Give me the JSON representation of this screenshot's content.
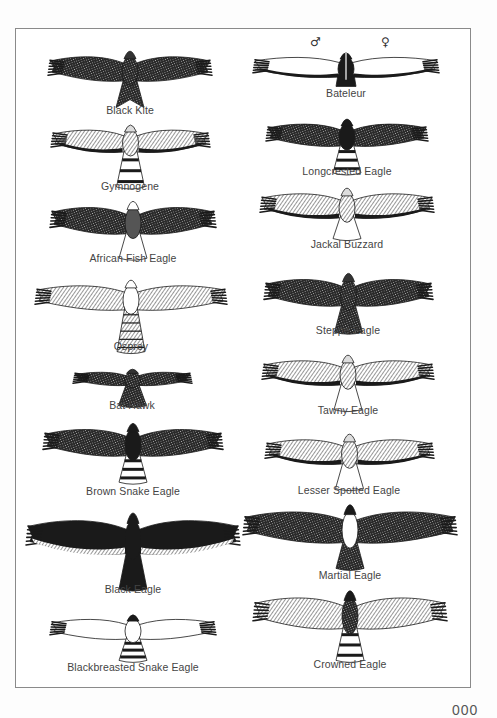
{
  "page": {
    "page_number": "000",
    "colors": {
      "ink": "#1a1a1a",
      "frame": "#8a8a8a",
      "caption": "#444444",
      "paper": "#ffffff"
    }
  },
  "plates": [
    {
      "name": "Black Kite",
      "column": "left",
      "cx": 130,
      "cy": 71,
      "span": 160,
      "wingDepth": 22,
      "tail": "forked",
      "tailLen": 30,
      "style": "dark",
      "capY": 110
    },
    {
      "name": "Gymnogene",
      "column": "left",
      "cx": 130,
      "cy": 143,
      "span": 155,
      "wingDepth": 20,
      "tail": "banded",
      "tailLen": 38,
      "style": "pale-dark-edge",
      "capY": 186
    },
    {
      "name": "African Fish Eagle",
      "column": "left",
      "cx": 133,
      "cy": 223,
      "span": 162,
      "wingDepth": 24,
      "tail": "pale-fan",
      "tailLen": 28,
      "style": "dark-white-head",
      "capY": 258
    },
    {
      "name": "Osprey",
      "column": "left",
      "cx": 131,
      "cy": 300,
      "span": 188,
      "wingDepth": 22,
      "tail": "barred",
      "tailLen": 45,
      "style": "pale-barred",
      "capY": 346
    },
    {
      "name": "Bat Hawk",
      "column": "left",
      "cx": 132,
      "cy": 380,
      "span": 115,
      "wingDepth": 12,
      "tail": "short-dark",
      "tailLen": 22,
      "style": "dark",
      "capY": 405
    },
    {
      "name": "Brown Snake Eagle",
      "column": "left",
      "cx": 133,
      "cy": 445,
      "span": 176,
      "wingDepth": 24,
      "tail": "banded",
      "tailLen": 30,
      "style": "dark-pale-flight",
      "capY": 491
    },
    {
      "name": "Black Eagle",
      "column": "left",
      "cx": 133,
      "cy": 540,
      "span": 210,
      "wingDepth": 30,
      "tail": "black-fan",
      "tailLen": 40,
      "style": "black-pale-trailing",
      "capY": 589
    },
    {
      "name": "Blackbreasted Snake Eagle",
      "column": "left",
      "cx": 133,
      "cy": 631,
      "span": 162,
      "wingDepth": 18,
      "tail": "banded",
      "tailLen": 24,
      "style": "pale-black-head",
      "capY": 667
    },
    {
      "name": "Bateleur",
      "column": "right",
      "cx": 346,
      "cy": 69,
      "span": 182,
      "wingDepth": 18,
      "tail": "stub",
      "tailLen": 12,
      "style": "bateleur",
      "capY": 93
    },
    {
      "name": "Longcrested Eagle",
      "column": "right",
      "cx": 347,
      "cy": 137,
      "span": 158,
      "wingDepth": 20,
      "tail": "banded",
      "tailLen": 30,
      "style": "dark-pale-flight",
      "capY": 171
    },
    {
      "name": "Jackal Buzzard",
      "column": "right",
      "cx": 347,
      "cy": 208,
      "span": 170,
      "wingDepth": 22,
      "tail": "pale-fan",
      "tailLen": 24,
      "style": "pale-dark-edge",
      "capY": 244
    },
    {
      "name": "Steppe Eagle",
      "column": "right",
      "cx": 348,
      "cy": 295,
      "span": 165,
      "wingDepth": 24,
      "tail": "dark-fan",
      "tailLen": 30,
      "style": "dark",
      "capY": 330
    },
    {
      "name": "Tawny Eagle",
      "column": "right",
      "cx": 348,
      "cy": 375,
      "span": 168,
      "wingDepth": 22,
      "tail": "dark-fan",
      "tailLen": 28,
      "style": "pale-dark-edge",
      "capY": 410
    },
    {
      "name": "Lesser Spotted Eagle",
      "column": "right",
      "cx": 349,
      "cy": 454,
      "span": 165,
      "wingDepth": 22,
      "tail": "dark-fan",
      "tailLen": 28,
      "style": "pale-dark-edge",
      "capY": 490
    },
    {
      "name": "Martial Eagle",
      "column": "right",
      "cx": 350,
      "cy": 530,
      "span": 210,
      "wingDepth": 28,
      "tail": "dark-fan",
      "tailLen": 30,
      "style": "dark-white-body",
      "capY": 575
    },
    {
      "name": "Crowned Eagle",
      "column": "right",
      "cx": 350,
      "cy": 616,
      "span": 190,
      "wingDepth": 28,
      "tail": "banded",
      "tailLen": 36,
      "style": "barred",
      "capY": 664
    }
  ],
  "bateleur_sexes": {
    "male": "♂",
    "female": "♀"
  }
}
